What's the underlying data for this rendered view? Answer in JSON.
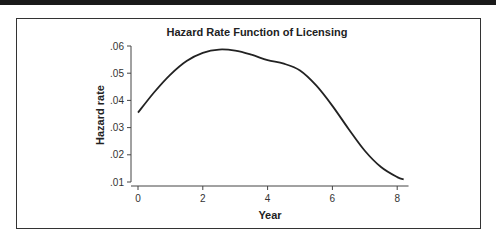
{
  "chart_data": {
    "type": "line",
    "title": "Hazard Rate Function of Licensing",
    "xlabel": "Year",
    "ylabel": "Hazard rate",
    "xlim": [
      0,
      8.3
    ],
    "ylim": [
      0.01,
      0.06
    ],
    "xticks": [
      "0",
      "2",
      "4",
      "6",
      "8"
    ],
    "yticks": [
      ".01",
      ".02",
      ".03",
      ".04",
      ".05",
      ".06"
    ],
    "grid": false,
    "legend": null,
    "series": [
      {
        "name": "Hazard rate",
        "x": [
          0,
          0.5,
          1.0,
          1.5,
          2.0,
          2.5,
          3.0,
          3.5,
          4.0,
          4.5,
          5.0,
          5.5,
          6.0,
          6.5,
          7.0,
          7.5,
          8.0,
          8.2
        ],
        "values": [
          0.0355,
          0.043,
          0.0495,
          0.0545,
          0.0575,
          0.0587,
          0.0583,
          0.0568,
          0.0548,
          0.0535,
          0.051,
          0.0455,
          0.038,
          0.0295,
          0.0215,
          0.0155,
          0.0118,
          0.011
        ]
      }
    ]
  }
}
